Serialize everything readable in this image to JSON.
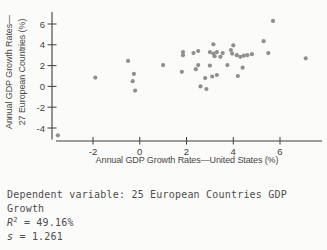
{
  "chart_data": {
    "type": "scatter",
    "title": "",
    "xlabel": "Annual GDP Growth Rates—United States (%)",
    "ylabel_line1": "Annual GDP Growth Rates—",
    "ylabel_line2": "27 European Countries (%)",
    "x_ticks": [
      -2,
      0,
      2,
      4,
      6
    ],
    "y_ticks": [
      6,
      4,
      2,
      0,
      -2,
      -4
    ],
    "xlim": [
      -3.8,
      7.8
    ],
    "ylim": [
      -5.2,
      7.2
    ],
    "grid": false,
    "legend": false,
    "point_color": "#8f8f8f",
    "axis_color": "#3e3e3e",
    "points": [
      [
        -3.5,
        -4.7
      ],
      [
        -1.9,
        0.85
      ],
      [
        -0.5,
        2.45
      ],
      [
        -0.25,
        1.2
      ],
      [
        -0.3,
        0.5
      ],
      [
        -0.2,
        -0.4
      ],
      [
        1.0,
        2.05
      ],
      [
        1.8,
        1.4
      ],
      [
        1.85,
        3.3
      ],
      [
        1.85,
        3.0
      ],
      [
        2.3,
        3.2
      ],
      [
        2.5,
        3.4
      ],
      [
        2.4,
        1.65
      ],
      [
        2.5,
        2.05
      ],
      [
        2.6,
        0.0
      ],
      [
        2.85,
        -0.25
      ],
      [
        2.8,
        0.8
      ],
      [
        3.0,
        2.0
      ],
      [
        3.0,
        3.3
      ],
      [
        3.15,
        3.15
      ],
      [
        3.3,
        3.3
      ],
      [
        3.2,
        2.9
      ],
      [
        3.15,
        4.05
      ],
      [
        3.1,
        0.95
      ],
      [
        3.3,
        1.1
      ],
      [
        3.55,
        3.2
      ],
      [
        3.45,
        2.85
      ],
      [
        3.75,
        2.05
      ],
      [
        3.9,
        3.5
      ],
      [
        4.0,
        3.95
      ],
      [
        3.95,
        3.15
      ],
      [
        4.15,
        3.0
      ],
      [
        4.3,
        2.85
      ],
      [
        4.45,
        2.95
      ],
      [
        4.6,
        3.0
      ],
      [
        4.8,
        3.1
      ],
      [
        4.4,
        1.8
      ],
      [
        4.2,
        1.0
      ],
      [
        5.3,
        4.35
      ],
      [
        5.5,
        3.2
      ],
      [
        5.7,
        6.3
      ],
      [
        7.1,
        2.7
      ]
    ]
  },
  "caption": {
    "line1": "Dependent variable: 25 European Countries GDP",
    "line2": "Growth",
    "r2_var": "R",
    "r2_sup": "2",
    "r2_rest": " = 49.16%",
    "s_var": "s",
    "s_rest": " = 1.261"
  }
}
